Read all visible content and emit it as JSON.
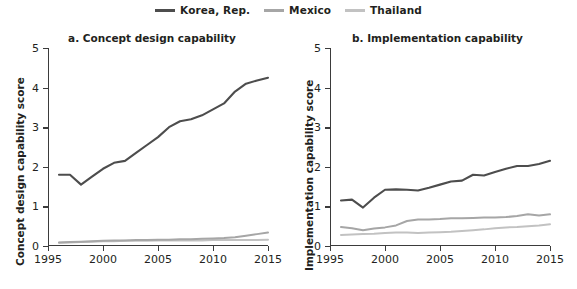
{
  "legend": {
    "position": "top-center",
    "items": [
      {
        "label": "Korea, Rep.",
        "color": "#4d4d4d"
      },
      {
        "label": "Mexico",
        "color": "#a6a6a6"
      },
      {
        "label": "Thailand",
        "color": "#c2c2c2"
      }
    ]
  },
  "chart_data": [
    {
      "type": "line",
      "title": "a. Concept design capability",
      "xlabel": "",
      "ylabel": "Concept design capability score",
      "xlim": [
        1995,
        2015
      ],
      "ylim": [
        0,
        5
      ],
      "grid": false,
      "xticks": [
        1995,
        2000,
        2005,
        2010,
        2015
      ],
      "yticks": [
        0,
        1,
        2,
        3,
        4,
        5
      ],
      "x": [
        1996,
        1997,
        1998,
        1999,
        2000,
        2001,
        2002,
        2003,
        2004,
        2005,
        2006,
        2007,
        2008,
        2009,
        2010,
        2011,
        2012,
        2013,
        2014,
        2015
      ],
      "series": [
        {
          "name": "Korea, Rep.",
          "color": "#4d4d4d",
          "values": [
            1.8,
            1.8,
            1.55,
            1.75,
            1.95,
            2.1,
            2.15,
            2.35,
            2.55,
            2.75,
            3.0,
            3.15,
            3.2,
            3.3,
            3.45,
            3.6,
            3.9,
            4.1,
            4.18,
            4.25
          ]
        },
        {
          "name": "Mexico",
          "color": "#a6a6a6",
          "values": [
            0.09,
            0.1,
            0.11,
            0.12,
            0.13,
            0.14,
            0.14,
            0.15,
            0.15,
            0.16,
            0.16,
            0.17,
            0.17,
            0.18,
            0.19,
            0.2,
            0.22,
            0.26,
            0.3,
            0.34
          ]
        },
        {
          "name": "Thailand",
          "color": "#c2c2c2",
          "values": [
            0.08,
            0.09,
            0.1,
            0.11,
            0.12,
            0.12,
            0.13,
            0.13,
            0.13,
            0.14,
            0.14,
            0.14,
            0.14,
            0.14,
            0.15,
            0.15,
            0.15,
            0.15,
            0.15,
            0.16
          ]
        }
      ]
    },
    {
      "type": "line",
      "title": "b. Implementation capability",
      "xlabel": "",
      "ylabel": "Implementation capability score",
      "xlim": [
        1995,
        2015
      ],
      "ylim": [
        0,
        5
      ],
      "grid": false,
      "xticks": [
        1995,
        2000,
        2005,
        2010,
        2015
      ],
      "yticks": [
        0,
        1,
        2,
        3,
        4,
        5
      ],
      "x": [
        1996,
        1997,
        1998,
        1999,
        2000,
        2001,
        2002,
        2003,
        2004,
        2005,
        2006,
        2007,
        2008,
        2009,
        2010,
        2011,
        2012,
        2013,
        2014,
        2015
      ],
      "series": [
        {
          "name": "Korea, Rep.",
          "color": "#4d4d4d",
          "values": [
            1.15,
            1.17,
            0.97,
            1.22,
            1.42,
            1.43,
            1.42,
            1.4,
            1.47,
            1.55,
            1.63,
            1.65,
            1.8,
            1.78,
            1.87,
            1.95,
            2.02,
            2.02,
            2.07,
            2.15
          ]
        },
        {
          "name": "Mexico",
          "color": "#a6a6a6",
          "values": [
            0.48,
            0.45,
            0.4,
            0.44,
            0.47,
            0.52,
            0.63,
            0.67,
            0.67,
            0.68,
            0.7,
            0.7,
            0.71,
            0.72,
            0.72,
            0.73,
            0.76,
            0.8,
            0.77,
            0.8
          ]
        },
        {
          "name": "Thailand",
          "color": "#c2c2c2",
          "values": [
            0.28,
            0.29,
            0.3,
            0.31,
            0.33,
            0.34,
            0.34,
            0.33,
            0.34,
            0.35,
            0.36,
            0.38,
            0.4,
            0.42,
            0.45,
            0.47,
            0.48,
            0.5,
            0.52,
            0.55
          ]
        }
      ]
    }
  ]
}
